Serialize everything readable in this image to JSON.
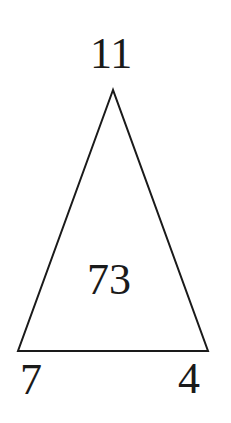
{
  "diagram": {
    "type": "number-triangle",
    "apex_value": "11",
    "center_value": "73",
    "bottom_left_value": "7",
    "bottom_right_value": "4",
    "stroke_color": "#1a1a1a"
  }
}
